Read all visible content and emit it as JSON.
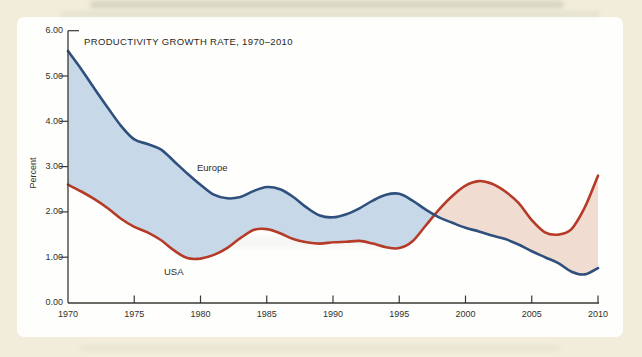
{
  "page": {
    "background_color": "#f1edda",
    "panel_color": "#fefefc"
  },
  "chart_data": {
    "type": "area",
    "title": "PRODUCTIVITY GROWTH RATE, 1970–2010",
    "ylabel": "Percent",
    "xlabel": "",
    "ylim": [
      0,
      6
    ],
    "grid": false,
    "legend_position": "inline-labels",
    "y_ticks": [
      "0.00",
      "1.00",
      "2.00",
      "3.00",
      "4.00",
      "5.00",
      "6.00"
    ],
    "x_ticks": [
      1970,
      1975,
      1980,
      1985,
      1990,
      1995,
      2000,
      2005,
      2010
    ],
    "x": [
      1970,
      1971,
      1972,
      1973,
      1974,
      1975,
      1976,
      1977,
      1978,
      1979,
      1980,
      1981,
      1982,
      1983,
      1984,
      1985,
      1986,
      1987,
      1988,
      1989,
      1990,
      1991,
      1992,
      1993,
      1994,
      1995,
      1996,
      1997,
      1998,
      1999,
      2000,
      2001,
      2002,
      2003,
      2004,
      2005,
      2006,
      2007,
      2008,
      2009,
      2010
    ],
    "series": [
      {
        "name": "Europe",
        "line_color": "#2f4f7d",
        "fill_color": "#c7d9e8",
        "values": [
          5.55,
          5.15,
          4.72,
          4.3,
          3.9,
          3.6,
          3.5,
          3.38,
          3.12,
          2.85,
          2.6,
          2.38,
          2.3,
          2.33,
          2.46,
          2.55,
          2.5,
          2.33,
          2.1,
          1.92,
          1.88,
          1.95,
          2.08,
          2.25,
          2.38,
          2.4,
          2.25,
          2.05,
          1.88,
          1.76,
          1.65,
          1.57,
          1.48,
          1.4,
          1.28,
          1.13,
          1.0,
          0.87,
          0.68,
          0.62,
          0.76
        ]
      },
      {
        "name": "USA",
        "line_color": "#b53a28",
        "fill_color": "#f1dcd2",
        "values": [
          2.6,
          2.45,
          2.28,
          2.08,
          1.85,
          1.67,
          1.55,
          1.38,
          1.15,
          0.98,
          0.97,
          1.05,
          1.2,
          1.42,
          1.6,
          1.62,
          1.53,
          1.4,
          1.33,
          1.3,
          1.33,
          1.34,
          1.36,
          1.3,
          1.22,
          1.2,
          1.35,
          1.7,
          2.05,
          2.35,
          2.58,
          2.68,
          2.62,
          2.45,
          2.2,
          1.82,
          1.55,
          1.5,
          1.62,
          2.1,
          2.8
        ]
      }
    ],
    "axis_color": "#3a3833",
    "fill_note": "shaded band between the two lines; blue where Europe is above USA, pink where USA is above Europe"
  }
}
